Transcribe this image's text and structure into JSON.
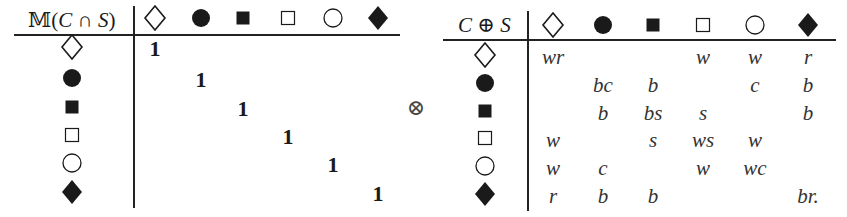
{
  "left_table": {
    "header_label": "𝕄(C ∩ S)",
    "header_parts": {
      "prefix": "𝕄(",
      "a": "C",
      "op": " ∩ ",
      "b": "S",
      "suffix": ")"
    },
    "columns": [
      "open-diamond",
      "filled-circle",
      "filled-square",
      "open-square",
      "open-circle",
      "filled-diamond"
    ],
    "rows": [
      "open-diamond",
      "filled-circle",
      "filled-square",
      "open-square",
      "open-circle",
      "filled-diamond"
    ],
    "cells": [
      [
        "1",
        "",
        "",
        "",
        "",
        ""
      ],
      [
        "",
        "1",
        "",
        "",
        "",
        ""
      ],
      [
        "",
        "",
        "1",
        "",
        "",
        ""
      ],
      [
        "",
        "",
        "",
        "1",
        "",
        ""
      ],
      [
        "",
        "",
        "",
        "",
        "1",
        ""
      ],
      [
        "",
        "",
        "",
        "",
        "",
        "1"
      ]
    ]
  },
  "operator": "⊗",
  "right_table": {
    "header_label": "C ⊕ S",
    "header_parts": {
      "a": "C",
      "op": " ⊕ ",
      "b": "S"
    },
    "columns": [
      "open-diamond",
      "filled-circle",
      "filled-square",
      "open-square",
      "open-circle",
      "filled-diamond"
    ],
    "rows": [
      "open-diamond",
      "filled-circle",
      "filled-square",
      "open-square",
      "open-circle",
      "filled-diamond"
    ],
    "cells": [
      [
        "wr",
        "",
        "",
        "w",
        "w",
        "r"
      ],
      [
        "",
        "bc",
        "b",
        "",
        "c",
        "b"
      ],
      [
        "",
        "b",
        "bs",
        "s",
        "",
        "b"
      ],
      [
        "w",
        "",
        "s",
        "ws",
        "w",
        ""
      ],
      [
        "w",
        "c",
        "",
        "w",
        "wc",
        ""
      ],
      [
        "r",
        "b",
        "b",
        "",
        "",
        "br."
      ]
    ]
  }
}
